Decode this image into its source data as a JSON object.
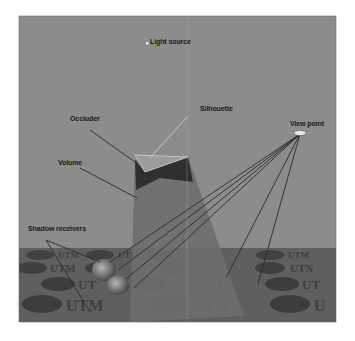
{
  "figure": {
    "labels": {
      "light_source": "Light source",
      "silhouette": "Silhouette",
      "occluder": "Occluder",
      "view_point": "View point",
      "volume": "Volume",
      "shadow_receivers": "Shadow receivers"
    },
    "floor_texture_text": [
      "UTM",
      "UTM",
      "UTM",
      "UTM"
    ],
    "colors": {
      "background": "#8c8c8c",
      "floor": "#5e5e5e",
      "volume_light": "#6d6d6d",
      "volume_dark": "#2e2e2e",
      "occluder": "#9a9a9a",
      "lines": "#2a2a2a",
      "silhouette_line": "#c8c8c8"
    }
  }
}
